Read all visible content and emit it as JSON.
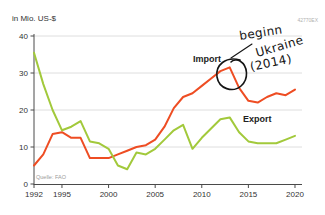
{
  "header": {
    "unit_label": "in Mio. US-$",
    "figure_id": "42770EX"
  },
  "source": {
    "label": "Quelle: FAO"
  },
  "annotation": {
    "line1": "beginn",
    "line2": "Ukraine",
    "line3": "(2014)",
    "full_text": "beginn Ukraine (2014)",
    "ink_color": "#141414"
  },
  "labels": {
    "import": "Import",
    "export": "Export"
  },
  "chart_data": {
    "type": "line",
    "title": "",
    "ylabel": "in Mio. US-$",
    "xlabel": "",
    "xlim": [
      1992,
      2020
    ],
    "ylim": [
      0,
      40
    ],
    "grid": "horizontal",
    "legend": "inline-labels",
    "x": [
      1992,
      1993,
      1994,
      1995,
      1996,
      1997,
      1998,
      1999,
      2000,
      2001,
      2002,
      2003,
      2004,
      2005,
      2006,
      2007,
      2008,
      2009,
      2010,
      2011,
      2012,
      2013,
      2014,
      2015,
      2016,
      2017,
      2018,
      2019,
      2020
    ],
    "series": [
      {
        "name": "Import",
        "key": "import-line",
        "color": "#ee4d23",
        "values": [
          5,
          8,
          13.5,
          14,
          12.5,
          12.5,
          7,
          7,
          7,
          8,
          9,
          10,
          10.5,
          12,
          15.5,
          20.5,
          23.5,
          24.5,
          26.5,
          28.5,
          30.5,
          31.5,
          26,
          22.5,
          22,
          23.5,
          24.5,
          24,
          25.5
        ]
      },
      {
        "name": "Export",
        "key": "export-line",
        "color": "#a2c93b",
        "values": [
          35.5,
          27,
          20,
          14.5,
          15.5,
          17,
          11.5,
          11,
          9.5,
          5,
          4,
          8.5,
          8,
          9.5,
          12,
          14.5,
          16,
          9.5,
          12.5,
          15,
          17.5,
          18,
          14,
          11.5,
          11,
          11,
          11,
          12,
          13
        ]
      }
    ],
    "x_ticks": [
      1992,
      1995,
      2000,
      2005,
      2010,
      2015,
      2020
    ],
    "y_ticks": [
      0,
      10,
      20,
      30,
      40
    ],
    "annotated_point": {
      "series": "Import",
      "x": 2013,
      "y": 31.5
    },
    "source": "Quelle: FAO"
  }
}
